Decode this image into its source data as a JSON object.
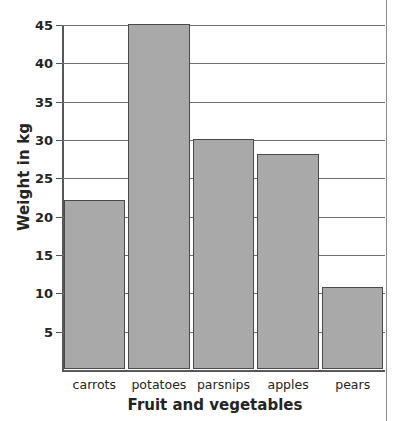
{
  "chart_data": {
    "type": "bar",
    "title": "",
    "xlabel": "Fruit and vegetables",
    "ylabel": "Weight in kg",
    "categories": [
      "carrots",
      "potatoes",
      "parsnips",
      "apples",
      "pears"
    ],
    "values": [
      22,
      45,
      30,
      28,
      10.7
    ],
    "ylim": [
      0,
      45
    ],
    "yticks": [
      5,
      10,
      15,
      20,
      25,
      30,
      35,
      40,
      45
    ],
    "ytick_labels": [
      "5",
      "10",
      "15",
      "20",
      "25",
      "30",
      "35",
      "40",
      "45"
    ],
    "grid": true,
    "legend": false,
    "bar_color": "#a9a9a9",
    "bar_edge_color": "#4a4a4a",
    "axis_color": "#585858",
    "grid_color": "#6e6e6e",
    "background_color": "#ffffff"
  },
  "axis": {
    "y_title": "Weight in kg",
    "x_title": "Fruit and vegetables"
  },
  "ticks": [
    {
      "label": "45",
      "value": 45
    },
    {
      "label": "40",
      "value": 40
    },
    {
      "label": "35",
      "value": 35
    },
    {
      "label": "30",
      "value": 30
    },
    {
      "label": "25",
      "value": 25
    },
    {
      "label": "20",
      "value": 20
    },
    {
      "label": "15",
      "value": 15
    },
    {
      "label": "10",
      "value": 10
    },
    {
      "label": "5",
      "value": 5
    }
  ],
  "bars": [
    {
      "label": "carrots",
      "value": 22
    },
    {
      "label": "potatoes",
      "value": 45
    },
    {
      "label": "parsnips",
      "value": 30
    },
    {
      "label": "apples",
      "value": 28
    },
    {
      "label": "pears",
      "value": 10.7
    }
  ]
}
